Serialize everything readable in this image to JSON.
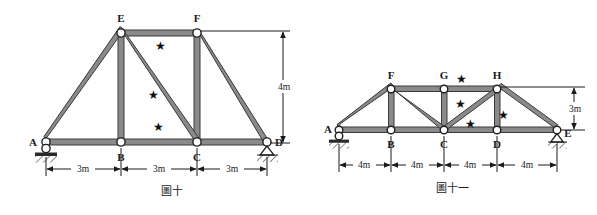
{
  "page": {
    "background_color": "#ffffff",
    "member_fill": "#8a8a8a",
    "member_stroke": "#3a3a3a",
    "node_fill": "#ffffff",
    "node_stroke": "#202020",
    "dim_color": "#1a1a1a",
    "star_glyph": "★"
  },
  "figures": [
    {
      "id": "figure-10",
      "caption": "圖十",
      "nodes": [
        {
          "label": "A",
          "x": 0,
          "y": 0
        },
        {
          "label": "B",
          "x": 3,
          "y": 0
        },
        {
          "label": "C",
          "x": 6,
          "y": 0
        },
        {
          "label": "D",
          "x": 9,
          "y": 0
        },
        {
          "label": "E",
          "x": 3,
          "y": 4
        },
        {
          "label": "F",
          "x": 6,
          "y": 4
        }
      ],
      "members": [
        {
          "from": "A",
          "to": "B"
        },
        {
          "from": "B",
          "to": "C"
        },
        {
          "from": "C",
          "to": "D"
        },
        {
          "from": "A",
          "to": "E"
        },
        {
          "from": "E",
          "to": "F"
        },
        {
          "from": "F",
          "to": "D"
        },
        {
          "from": "E",
          "to": "B"
        },
        {
          "from": "F",
          "to": "C"
        },
        {
          "from": "E",
          "to": "C"
        }
      ],
      "marked_members": [
        "E-F",
        "E-C",
        "B-C"
      ],
      "supports": [
        {
          "at": "A",
          "type": "pin"
        },
        {
          "at": "D",
          "type": "roller"
        }
      ],
      "horizontal_dimensions": [
        "3m",
        "3m",
        "3m"
      ],
      "vertical_dimension": "4m"
    },
    {
      "id": "figure-11",
      "caption": "圖十一",
      "nodes": [
        {
          "label": "A",
          "x": 0,
          "y": 0
        },
        {
          "label": "B",
          "x": 4,
          "y": 0
        },
        {
          "label": "C",
          "x": 8,
          "y": 0
        },
        {
          "label": "D",
          "x": 12,
          "y": 0
        },
        {
          "label": "E",
          "x": 16,
          "y": 0
        },
        {
          "label": "F",
          "x": 4,
          "y": 3
        },
        {
          "label": "G",
          "x": 8,
          "y": 3
        },
        {
          "label": "H",
          "x": 12,
          "y": 3
        }
      ],
      "members": [
        {
          "from": "A",
          "to": "B"
        },
        {
          "from": "B",
          "to": "C"
        },
        {
          "from": "C",
          "to": "D"
        },
        {
          "from": "D",
          "to": "E"
        },
        {
          "from": "A",
          "to": "F"
        },
        {
          "from": "F",
          "to": "G"
        },
        {
          "from": "G",
          "to": "H"
        },
        {
          "from": "H",
          "to": "E"
        },
        {
          "from": "F",
          "to": "B"
        },
        {
          "from": "G",
          "to": "C"
        },
        {
          "from": "H",
          "to": "D"
        },
        {
          "from": "F",
          "to": "C"
        },
        {
          "from": "C",
          "to": "H"
        }
      ],
      "marked_members": [
        "G-H",
        "C-H",
        "C-D",
        "D-H"
      ],
      "supports": [
        {
          "at": "A",
          "type": "pin"
        },
        {
          "at": "E",
          "type": "roller"
        }
      ],
      "horizontal_dimensions": [
        "4m",
        "4m",
        "4m",
        "4m"
      ],
      "vertical_dimension": "3m"
    }
  ]
}
